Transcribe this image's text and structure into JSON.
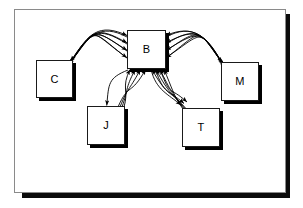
{
  "diagram": {
    "panel": {
      "background": "#ffffff",
      "border_color": "#8a8a8a",
      "shadow_color": "#0b0b0b"
    },
    "nodes": [
      {
        "id": "B",
        "label": "B",
        "x": 127,
        "y": 30,
        "w": 39,
        "h": 39
      },
      {
        "id": "C",
        "label": "C",
        "x": 36,
        "y": 60,
        "w": 37,
        "h": 38
      },
      {
        "id": "M",
        "label": "M",
        "x": 221,
        "y": 62,
        "w": 38,
        "h": 39
      },
      {
        "id": "J",
        "label": "J",
        "x": 87,
        "y": 106,
        "w": 38,
        "h": 39
      },
      {
        "id": "T",
        "label": "T",
        "x": 182,
        "y": 108,
        "w": 38,
        "h": 39
      }
    ],
    "edges": [
      {
        "from": "C",
        "to": "B",
        "bidirectional": true,
        "strands": 4
      },
      {
        "from": "M",
        "to": "B",
        "bidirectional": true,
        "strands": 4
      },
      {
        "from": "J",
        "to": "B",
        "bidirectional": true,
        "strands": 4
      },
      {
        "from": "T",
        "to": "B",
        "bidirectional": true,
        "strands": 4
      }
    ],
    "colors": {
      "stroke": "#000000",
      "node_fill": "#ffffff",
      "node_border": "#1a1a1a",
      "node_shadow": "#000000"
    }
  }
}
